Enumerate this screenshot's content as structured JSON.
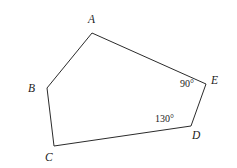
{
  "figure": {
    "kind": "geometry-diagram",
    "shape_name": "pentagon",
    "background_color": "#ffffff",
    "stroke_color": "#2b2b2b",
    "stroke_width": 1,
    "width": 237,
    "height": 168
  },
  "vertices": [
    {
      "id": "A",
      "label": "A",
      "x": 92,
      "y": 33,
      "label_x": 88,
      "label_y": 14
    },
    {
      "id": "B",
      "label": "B",
      "x": 47,
      "y": 88,
      "label_x": 28,
      "label_y": 83
    },
    {
      "id": "C",
      "label": "C",
      "x": 54,
      "y": 146,
      "label_x": 45,
      "label_y": 152
    },
    {
      "id": "D",
      "label": "D",
      "x": 191,
      "y": 126,
      "label_x": 192,
      "label_y": 130
    },
    {
      "id": "E",
      "label": "E",
      "x": 206,
      "y": 84,
      "label_x": 211,
      "label_y": 75
    }
  ],
  "edges": [
    {
      "from": "A",
      "to": "B"
    },
    {
      "from": "B",
      "to": "C"
    },
    {
      "from": "C",
      "to": "D"
    },
    {
      "from": "D",
      "to": "E"
    },
    {
      "from": "E",
      "to": "A"
    }
  ],
  "angle_labels": [
    {
      "id": "angle-at-E",
      "at_vertex": "E",
      "text": "90°",
      "x": 180,
      "y": 79
    },
    {
      "id": "angle-at-D",
      "at_vertex": "D",
      "text": "130°",
      "x": 155,
      "y": 114
    }
  ]
}
